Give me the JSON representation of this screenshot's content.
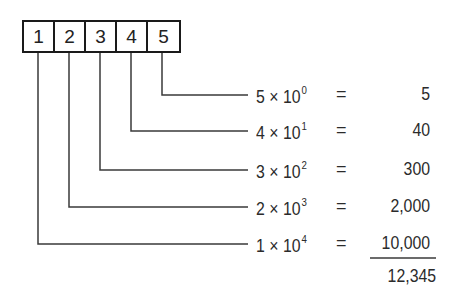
{
  "diagram": {
    "digits": [
      "1",
      "2",
      "3",
      "4",
      "5"
    ],
    "rows": [
      {
        "coef": "5",
        "times": "×",
        "base": "10",
        "exp": "0",
        "eq": "=",
        "result": "5"
      },
      {
        "coef": "4",
        "times": "×",
        "base": "10",
        "exp": "1",
        "eq": "=",
        "result": "40"
      },
      {
        "coef": "3",
        "times": "×",
        "base": "10",
        "exp": "2",
        "eq": "=",
        "result": "300"
      },
      {
        "coef": "2",
        "times": "×",
        "base": "10",
        "exp": "3",
        "eq": "=",
        "result": "2,000"
      },
      {
        "coef": "1",
        "times": "×",
        "base": "10",
        "exp": "4",
        "eq": "=",
        "result": "10,000"
      }
    ],
    "total": "12,345",
    "line_color": "#3a3a3a"
  }
}
